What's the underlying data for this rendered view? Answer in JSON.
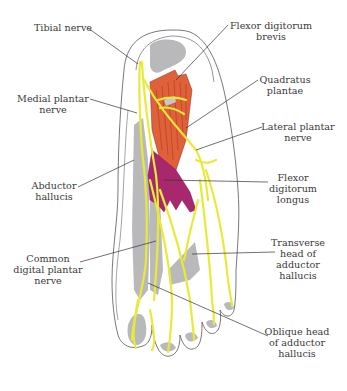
{
  "diagram": {
    "type": "anatomical",
    "colors": {
      "nerve": "#e8ea3a",
      "muscle_superficial": "#e0603a",
      "muscle_deep": "#a8286e",
      "bone_shadow": "#b9b9bb",
      "outline": "#555555",
      "leader_line": "#333333",
      "text": "#3a3a3a"
    }
  },
  "labels": {
    "tibial_nerve": "Tibial nerve",
    "medial_plantar_nerve": "Medial plantar\nnerve",
    "abductor_hallucis": "Abductor\nhallucis",
    "common_digital_plantar_nerve": "Common\ndigital plantar\nnerve",
    "flexor_digitorum_brevis": "Flexor digitorum\nbrevis",
    "quadratus_plantae": "Quadratus\nplantae",
    "lateral_plantar_nerve": "Lateral plantar\nnerve",
    "flexor_digitorum_longus": "Flexor\ndigitorum\nlongus",
    "transverse_head_adductor_hallucis": "Transverse\nhead of\nadductor\nhallucis",
    "oblique_head_adductor_hallucis": "Oblique head\nof adductor\nhallucis"
  }
}
